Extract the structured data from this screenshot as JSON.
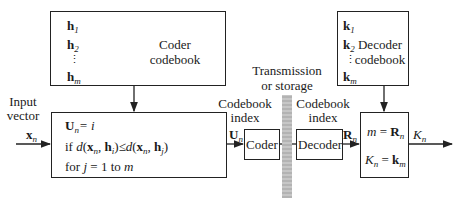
{
  "coder_codebook": {
    "title_line1": "Coder",
    "title_line2": "codebook",
    "entries": [
      "h",
      "h",
      "h"
    ],
    "entry_subscripts": [
      "1",
      "2",
      "m"
    ],
    "ellipsis": "⋮"
  },
  "decoder_codebook": {
    "title_line1": "Decoder",
    "title_line2": "codebook",
    "entries": [
      "k",
      "k",
      "k"
    ],
    "entry_subscripts": [
      "1",
      "2",
      "m"
    ],
    "ellipsis": "⋮"
  },
  "input": {
    "label_line1": "Input",
    "label_line2": "vector",
    "symbol": "x",
    "symbol_sub": "n"
  },
  "encoder_rule": {
    "line1": {
      "lhs": "U",
      "lhs_sub": "n",
      "rhs": "= i"
    },
    "line2": {
      "prefix": "if ",
      "text": "d(x_n, h_i) ≤ d(x_n, h_j)"
    },
    "line3": {
      "prefix": "for ",
      "var": "j",
      "text": " = 1 to ",
      "end": "m"
    }
  },
  "coder_index": {
    "label_line1": "Codebook",
    "label_line2": "index",
    "symbol": "U",
    "symbol_sub": "n"
  },
  "coder_block": {
    "label": "Coder"
  },
  "channel": {
    "label_line1": "Transmission",
    "label_line2": "or storage"
  },
  "decoder_index": {
    "label_line1": "Codebook",
    "label_line2": "index",
    "symbol": "R",
    "symbol_sub": "n"
  },
  "decoder_block": {
    "label": "Decoder"
  },
  "decoder_rule": {
    "line1": {
      "lhs": "m",
      "rhs": "R",
      "rhs_sub": "n"
    },
    "line2": {
      "lhs": "K",
      "lhs_sub": "n",
      "rhs": "k",
      "rhs_sub": "m"
    }
  },
  "output": {
    "symbol": "K",
    "symbol_sub": "n"
  }
}
